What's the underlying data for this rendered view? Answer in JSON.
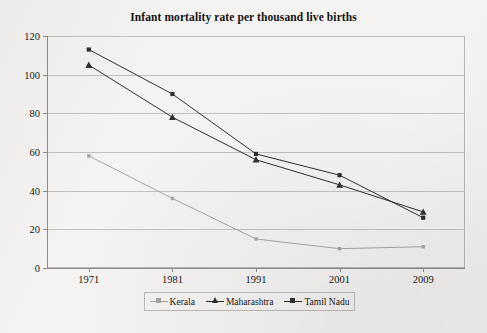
{
  "chart_data": {
    "type": "line",
    "title": "Infant mortality rate per thousand live births",
    "xlabel": "",
    "ylabel": "",
    "categories": [
      "1971",
      "1981",
      "1991",
      "2001",
      "2009"
    ],
    "series": [
      {
        "name": "Kerala",
        "values": [
          58,
          36,
          15,
          10,
          11
        ],
        "color": "#a8a6a3",
        "marker": "square"
      },
      {
        "name": "Maharashtra",
        "values": [
          105,
          78,
          56,
          43,
          29
        ],
        "color": "#2f2f2f",
        "marker": "triangle"
      },
      {
        "name": "Tamil Nadu",
        "values": [
          113,
          90,
          59,
          48,
          26
        ],
        "color": "#2f2f2f",
        "marker": "square"
      }
    ],
    "ylim": [
      0,
      120
    ],
    "ytick_labels": [
      "0",
      "20",
      "40",
      "60",
      "80",
      "100",
      "120"
    ],
    "ytick_values": [
      0,
      20,
      40,
      60,
      80,
      100,
      120
    ],
    "grid": true,
    "legend_position": "bottom"
  },
  "legend": {
    "entries": [
      {
        "label": "Kerala"
      },
      {
        "label": "Maharashtra"
      },
      {
        "label": "Tamil Nadu"
      }
    ]
  },
  "colors": {
    "kerala": "#a8a6a3",
    "maharashtra": "#2f2f2f",
    "tamil_nadu": "#2f2f2f",
    "gridline": "#c3c1be",
    "axis": "#8f8d8a",
    "background": "#f4f3f1",
    "text": "#171717"
  }
}
